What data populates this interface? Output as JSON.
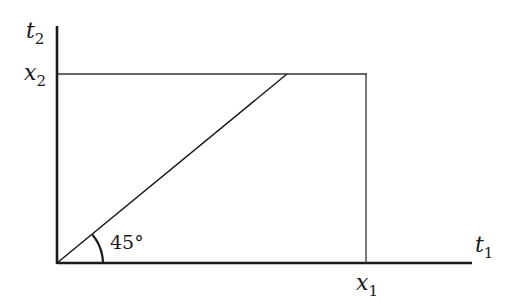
{
  "diagram": {
    "axes": {
      "vertical": {
        "var": "t",
        "sub": "2"
      },
      "horizontal": {
        "var": "t",
        "sub": "1"
      }
    },
    "ticks": {
      "x": {
        "var": "x",
        "sub": "1"
      },
      "y": {
        "var": "x",
        "sub": "2"
      }
    },
    "angle_label": "45°",
    "colors": {
      "line": "#1a1a1a",
      "thin": "#333333"
    }
  }
}
